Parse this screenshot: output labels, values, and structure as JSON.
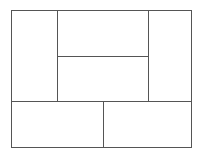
{
  "diagram": {
    "type": "rectangle-partition",
    "panels": [
      {
        "name": "left-tall",
        "x": 11,
        "y": 10,
        "w": 46,
        "h": 91
      },
      {
        "name": "center-top",
        "x": 57,
        "y": 10,
        "w": 91,
        "h": 46
      },
      {
        "name": "center-bottom",
        "x": 57,
        "y": 56,
        "w": 91,
        "h": 45
      },
      {
        "name": "right-tall",
        "x": 148,
        "y": 10,
        "w": 44,
        "h": 91
      },
      {
        "name": "bottom-left",
        "x": 11,
        "y": 101,
        "w": 92,
        "h": 47
      },
      {
        "name": "bottom-right",
        "x": 103,
        "y": 101,
        "w": 89,
        "h": 47
      }
    ],
    "line_color": "#555555"
  }
}
